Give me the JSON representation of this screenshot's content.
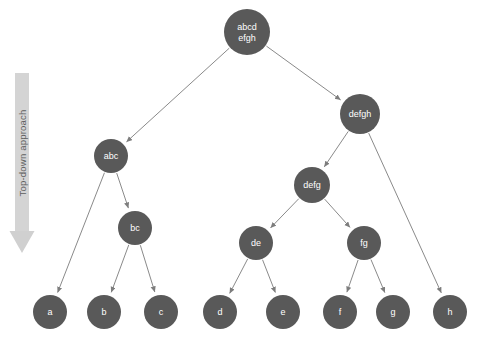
{
  "canvas": {
    "width": 483,
    "height": 350,
    "background": "#ffffff"
  },
  "style": {
    "node_fill": "#595959",
    "node_text": "#ffffff",
    "edge_color": "#8a8a8a",
    "band_fill": "#d4d4d4",
    "band_text": "#5e5e5e"
  },
  "annotation": {
    "arrow_label": "Top-down approach",
    "arrow_direction": "down"
  },
  "diagram": {
    "type": "tree",
    "title": "Top-down approach",
    "nodes": [
      {
        "id": "root",
        "label": "abcd efgh",
        "lines": [
          "abcd",
          "efgh"
        ],
        "cx": 247,
        "cy": 32,
        "r": 23,
        "level": 0
      },
      {
        "id": "abc",
        "label": "abc",
        "lines": [
          "abc"
        ],
        "cx": 111,
        "cy": 156,
        "r": 17,
        "level": 1
      },
      {
        "id": "defgh",
        "label": "defgh",
        "lines": [
          "defgh"
        ],
        "cx": 360,
        "cy": 114,
        "r": 20,
        "level": 1
      },
      {
        "id": "bc",
        "label": "bc",
        "lines": [
          "bc"
        ],
        "cx": 135,
        "cy": 228,
        "r": 17,
        "level": 2
      },
      {
        "id": "defg",
        "label": "defg",
        "lines": [
          "defg"
        ],
        "cx": 312,
        "cy": 185,
        "r": 18,
        "level": 2
      },
      {
        "id": "de",
        "label": "de",
        "lines": [
          "de"
        ],
        "cx": 256,
        "cy": 243,
        "r": 17,
        "level": 3
      },
      {
        "id": "fg",
        "label": "fg",
        "lines": [
          "fg"
        ],
        "cx": 364,
        "cy": 243,
        "r": 17,
        "level": 3
      },
      {
        "id": "a",
        "label": "a",
        "lines": [
          "a"
        ],
        "cx": 50,
        "cy": 312,
        "r": 17,
        "level": 4
      },
      {
        "id": "b",
        "label": "b",
        "lines": [
          "b"
        ],
        "cx": 104,
        "cy": 312,
        "r": 17,
        "level": 4
      },
      {
        "id": "c",
        "label": "c",
        "lines": [
          "c"
        ],
        "cx": 161,
        "cy": 312,
        "r": 17,
        "level": 4
      },
      {
        "id": "d",
        "label": "d",
        "lines": [
          "d"
        ],
        "cx": 220,
        "cy": 312,
        "r": 17,
        "level": 4
      },
      {
        "id": "e",
        "label": "e",
        "lines": [
          "e"
        ],
        "cx": 283,
        "cy": 312,
        "r": 17,
        "level": 4
      },
      {
        "id": "f",
        "label": "f",
        "lines": [
          "f"
        ],
        "cx": 340,
        "cy": 312,
        "r": 17,
        "level": 4
      },
      {
        "id": "g",
        "label": "g",
        "lines": [
          "g"
        ],
        "cx": 393,
        "cy": 312,
        "r": 17,
        "level": 4
      },
      {
        "id": "h",
        "label": "h",
        "lines": [
          "h"
        ],
        "cx": 450,
        "cy": 312,
        "r": 17,
        "level": 4
      }
    ],
    "edges": [
      {
        "from": "root",
        "to": "abc"
      },
      {
        "from": "root",
        "to": "defgh"
      },
      {
        "from": "abc",
        "to": "a"
      },
      {
        "from": "abc",
        "to": "bc"
      },
      {
        "from": "bc",
        "to": "b"
      },
      {
        "from": "bc",
        "to": "c"
      },
      {
        "from": "defgh",
        "to": "defg"
      },
      {
        "from": "defgh",
        "to": "h"
      },
      {
        "from": "defg",
        "to": "de"
      },
      {
        "from": "defg",
        "to": "fg"
      },
      {
        "from": "de",
        "to": "d"
      },
      {
        "from": "de",
        "to": "e"
      },
      {
        "from": "fg",
        "to": "f"
      },
      {
        "from": "fg",
        "to": "g"
      }
    ]
  }
}
